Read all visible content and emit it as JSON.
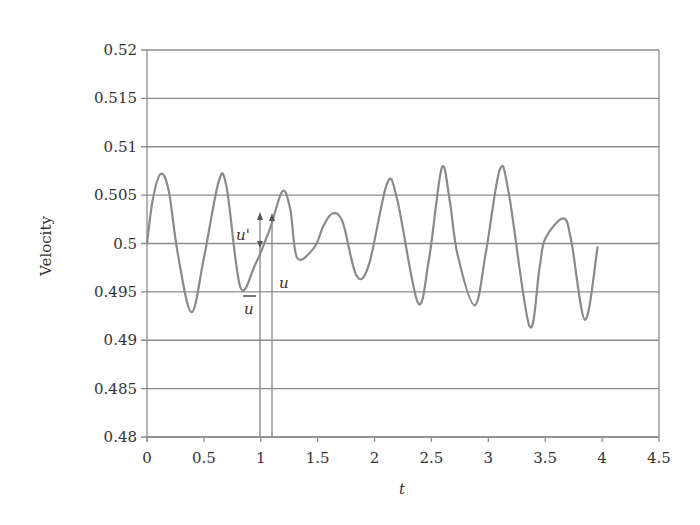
{
  "chart_data": {
    "type": "line",
    "title": "",
    "xlabel": "t",
    "ylabel": "Velocity",
    "xlim": [
      0,
      4.5
    ],
    "ylim": [
      0.48,
      0.52
    ],
    "x_ticks": [
      "0",
      "0.5",
      "1",
      "1.5",
      "2",
      "2.5",
      "3",
      "3.5",
      "4",
      "4.5"
    ],
    "y_ticks": [
      "0.48",
      "0.485",
      "0.49",
      "0.495",
      "0.5",
      "0.505",
      "0.51",
      "0.515",
      "0.52"
    ],
    "grid": "horizontal",
    "legend": "none",
    "series": [
      {
        "name": "u(t)",
        "color": "#8a8a8a",
        "x": [
          0,
          0.05,
          0.12,
          0.19,
          0.27,
          0.39,
          0.5,
          0.63,
          0.7,
          0.82,
          0.95,
          1.08,
          1.19,
          1.26,
          1.32,
          1.47,
          1.55,
          1.63,
          1.72,
          1.84,
          1.95,
          2.11,
          2.2,
          2.38,
          2.48,
          2.59,
          2.66,
          2.73,
          2.88,
          2.98,
          3.1,
          3.18,
          3.36,
          3.45,
          3.5,
          3.66,
          3.73,
          3.85,
          3.96
        ],
        "y": [
          0.5,
          0.5045,
          0.5072,
          0.5055,
          0.499,
          0.4929,
          0.4985,
          0.5064,
          0.5058,
          0.4955,
          0.4978,
          0.5015,
          0.5054,
          0.5035,
          0.4985,
          0.4996,
          0.5018,
          0.5031,
          0.5022,
          0.4967,
          0.4978,
          0.5062,
          0.5045,
          0.4939,
          0.4985,
          0.5078,
          0.5045,
          0.4988,
          0.4936,
          0.4992,
          0.5076,
          0.5052,
          0.4915,
          0.4975,
          0.5005,
          0.5026,
          0.5002,
          0.4921,
          0.4996
        ]
      }
    ],
    "annotations": [
      {
        "label": "u'",
        "type": "fluctuation-arrow",
        "x": 1.0,
        "from": 0.5,
        "to": 0.5023
      },
      {
        "label": "u",
        "type": "arrow",
        "x": 1.1,
        "from": 0.48,
        "to": 0.5023
      },
      {
        "label": "ū",
        "type": "arrow",
        "x": 1.0,
        "from": 0.48,
        "to": 0.5
      }
    ]
  },
  "labels": {
    "xlabel": "t",
    "ylabel": "Velocity",
    "u_prime": "u'",
    "u": "u",
    "u_bar": "u"
  },
  "colors": {
    "axis": "#8c8c8c",
    "grid": "#8c8c8c",
    "line": "#8a8a8a",
    "text": "#333333"
  }
}
